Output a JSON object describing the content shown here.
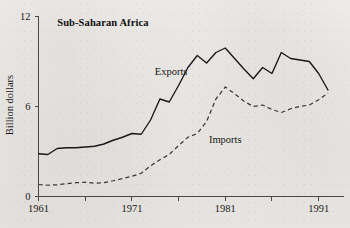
{
  "figure": {
    "panel_title": "Sub-Saharan Africa",
    "y_axis_title": "Billion dollars",
    "exports_label": "Exports",
    "imports_label": "Imports",
    "ink_color": "#17161a",
    "paper_color": "#eeecea"
  },
  "chart_data": {
    "type": "line",
    "title": "Sub-Saharan Africa",
    "xlabel": "",
    "ylabel": "Billion dollars",
    "xlim": [
      1961,
      1992
    ],
    "ylim": [
      0,
      12
    ],
    "yticks": [
      0,
      6,
      12
    ],
    "ytick_labels": [
      "0",
      "6",
      "12"
    ],
    "xticks": [
      1961,
      1966,
      1971,
      1976,
      1981,
      1986,
      1991
    ],
    "xtick_labels": [
      "1961",
      "",
      "1971",
      "",
      "1981",
      "",
      "1991"
    ],
    "grid": false,
    "legend": "inline-annotation",
    "x": [
      1961,
      1962,
      1963,
      1964,
      1965,
      1966,
      1967,
      1968,
      1969,
      1970,
      1971,
      1972,
      1973,
      1974,
      1975,
      1976,
      1977,
      1978,
      1979,
      1980,
      1981,
      1982,
      1983,
      1984,
      1985,
      1986,
      1987,
      1988,
      1989,
      1990,
      1991,
      1992
    ],
    "series": [
      {
        "name": "Exports",
        "style": "solid",
        "values": [
          2.85,
          2.8,
          3.2,
          3.25,
          3.25,
          3.3,
          3.35,
          3.5,
          3.75,
          3.95,
          4.2,
          4.15,
          5.1,
          6.5,
          6.3,
          7.4,
          8.6,
          9.4,
          8.9,
          9.6,
          9.9,
          9.2,
          8.5,
          7.85,
          8.6,
          8.2,
          9.6,
          9.2,
          9.1,
          9.0,
          8.2,
          7.1
        ]
      },
      {
        "name": "Imports",
        "style": "dashed",
        "values": [
          0.8,
          0.75,
          0.78,
          0.85,
          0.92,
          0.95,
          0.88,
          0.92,
          1.05,
          1.2,
          1.35,
          1.55,
          2.05,
          2.45,
          2.8,
          3.4,
          3.95,
          4.2,
          5.0,
          6.5,
          7.3,
          6.85,
          6.35,
          6.0,
          6.1,
          5.8,
          5.6,
          5.85,
          6.0,
          6.1,
          6.45,
          6.9
        ]
      }
    ],
    "annotations": [
      {
        "text": "Exports",
        "x": 1975.2,
        "y": 8.1
      },
      {
        "text": "Imports",
        "x": 1981.0,
        "y": 3.55
      },
      {
        "text": "Sub-Saharan Africa",
        "x": 1963.0,
        "y": 11.4
      }
    ]
  }
}
